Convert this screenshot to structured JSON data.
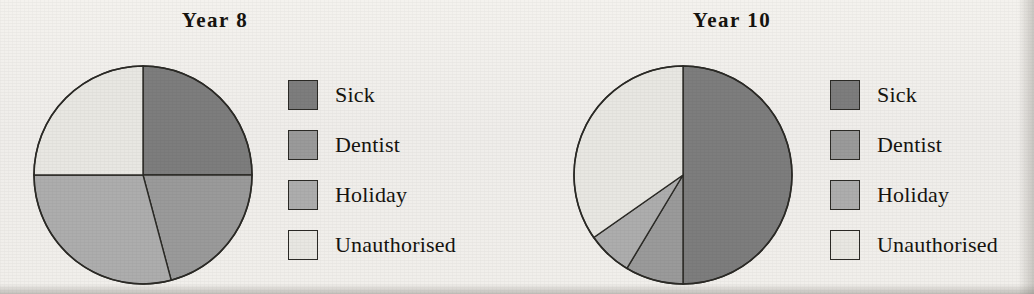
{
  "figure": {
    "background_color": "#f2f0ec",
    "outline_color": "#2b2a26"
  },
  "categories": [
    "Sick",
    "Dentist",
    "Holiday",
    "Unauthorised"
  ],
  "colors": {
    "Sick": "#7d7d7d",
    "Dentist": "#9a9a9a",
    "Holiday": "#adadad",
    "Unauthorised": "#e8e7e2"
  },
  "panels": [
    {
      "title": "Year  8",
      "legend": [
        {
          "label": "Sick",
          "color": "#7d7d7d"
        },
        {
          "label": "Dentist",
          "color": "#9a9a9a"
        },
        {
          "label": "Holiday",
          "color": "#adadad"
        },
        {
          "label": "Unauthorised",
          "color": "#e8e7e2"
        }
      ]
    },
    {
      "title": "Year 10",
      "legend": [
        {
          "label": "Sick",
          "color": "#7d7d7d"
        },
        {
          "label": "Dentist",
          "color": "#9a9a9a"
        },
        {
          "label": "Holiday",
          "color": "#adadad"
        },
        {
          "label": "Unauthorised",
          "color": "#e8e7e2"
        }
      ]
    }
  ],
  "chart_data": [
    {
      "type": "pie",
      "title": "Year  8",
      "labels": [
        "Sick",
        "Dentist",
        "Holiday",
        "Unauthorised"
      ],
      "values": [
        25,
        21,
        29,
        25
      ],
      "units": "percent",
      "angles_deg": [
        90,
        75,
        105,
        90
      ],
      "start_angle_deg": 0,
      "direction": "clockwise",
      "colors": [
        "#7d7d7d",
        "#9a9a9a",
        "#adadad",
        "#e8e7e2"
      ],
      "legend_position": "right",
      "grid": false
    },
    {
      "type": "pie",
      "title": "Year 10",
      "labels": [
        "Sick",
        "Dentist",
        "Holiday",
        "Unauthorised"
      ],
      "values": [
        50,
        9,
        7,
        34
      ],
      "units": "percent",
      "angles_deg": [
        180,
        31,
        24,
        125
      ],
      "start_angle_deg": 0,
      "direction": "clockwise",
      "colors": [
        "#7d7d7d",
        "#9a9a9a",
        "#adadad",
        "#e8e7e2"
      ],
      "legend_position": "right",
      "grid": false
    }
  ]
}
